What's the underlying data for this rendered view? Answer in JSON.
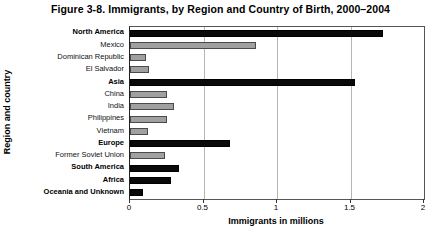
{
  "chart_data": {
    "type": "bar",
    "orientation": "horizontal",
    "title": "Figure 3-8. Immigrants, by Region and Country of Birth, 2000–2004",
    "xlabel": "Immigrants in millions",
    "ylabel": "Region and country",
    "xlim": [
      0,
      2
    ],
    "xticks": [
      0,
      0.5,
      1,
      1.5,
      2
    ],
    "xtick_labels": [
      "0",
      "0.5",
      "1",
      "1.5",
      "2"
    ],
    "grid": "vertical",
    "legend": null,
    "colors": {
      "region_bar": "#0a0a0a",
      "country_bar": "#a0a0a0",
      "country_bar_border": "#4a4a4a",
      "gridline": "#b5b5b5",
      "axis": "#333333",
      "background": "#ffffff"
    },
    "categories": [
      "North America",
      "Mexico",
      "Dominican Republic",
      "El Salvador",
      "Asia",
      "China",
      "India",
      "Philippines",
      "Vietnam",
      "Europe",
      "Former Soviet Union",
      "South America",
      "Africa",
      "Oceania and Unknown"
    ],
    "values": [
      1.72,
      0.86,
      0.11,
      0.13,
      1.53,
      0.25,
      0.3,
      0.25,
      0.12,
      0.68,
      0.24,
      0.33,
      0.28,
      0.09
    ],
    "levels": [
      "region",
      "country",
      "country",
      "country",
      "region",
      "country",
      "country",
      "country",
      "country",
      "region",
      "country",
      "region",
      "region",
      "region"
    ]
  }
}
